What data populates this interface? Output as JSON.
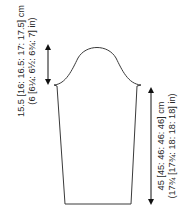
{
  "diagram": {
    "type": "knitting-schematic",
    "piece": "sleeve",
    "stroke_color": "#3a3a3a",
    "measurements": {
      "cap_height": {
        "line1": "15.5 [16: 16.5: 17: 17.5] cm",
        "line2": "(6 [6¼: 6½: 6¾: 7] in)"
      },
      "sleeve_length": {
        "line1": "45 [45: 46: 46: 46] cm",
        "line2": "(17¾ [17¾: 18: 18: 18] in)"
      }
    }
  }
}
